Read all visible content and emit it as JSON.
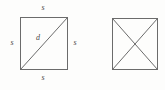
{
  "figure": {
    "background_color": "#fdfdfc",
    "stroke_color": "#6b6b6b",
    "label_color": "#4a4a4a",
    "stroke_width": 1,
    "shapes": [
      {
        "id": "left-square",
        "name": "square-with-single-diagonal",
        "x": 20,
        "y": 17,
        "width": 48,
        "height": 53,
        "diagonals": [
          "bottom-left-to-top-right"
        ],
        "labels": [
          {
            "id": "top",
            "text": "s",
            "position": "top-side"
          },
          {
            "id": "left",
            "text": "s",
            "position": "left-side"
          },
          {
            "id": "right",
            "text": "s",
            "position": "right-side"
          },
          {
            "id": "bottom",
            "text": "s",
            "position": "bottom-side"
          },
          {
            "id": "diag",
            "text": "d",
            "position": "diagonal-interior"
          }
        ]
      },
      {
        "id": "right-square",
        "name": "square-with-both-diagonals",
        "x": 112,
        "y": 18,
        "width": 46,
        "height": 52,
        "diagonals": [
          "top-left-to-bottom-right",
          "bottom-left-to-top-right"
        ],
        "labels": []
      }
    ]
  },
  "labels": {
    "side_top": "s",
    "side_left": "s",
    "side_right": "s",
    "side_bottom": "s",
    "diagonal": "d"
  }
}
